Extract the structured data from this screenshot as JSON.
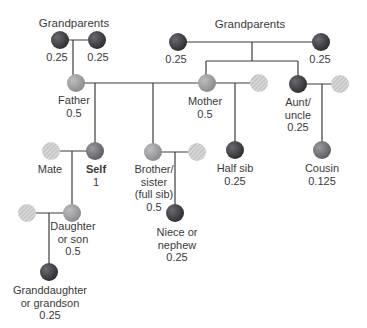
{
  "colors": {
    "line": "#3d3d3d",
    "full_dark": "#3f3f45",
    "mid": "#7a7a7e",
    "light": "#9c9c9e",
    "hatched": "#c8c8c8"
  },
  "groups": {
    "paternal_grandparents_label": "Grandparents",
    "maternal_grandparents_label": "Grandparents"
  },
  "nodes": {
    "pgp1": {
      "value": "0.25"
    },
    "pgp2": {
      "value": "0.25"
    },
    "mgp1": {
      "value": "0.25"
    },
    "mgp2": {
      "value": "0.25"
    },
    "father": {
      "label": "Father",
      "value": "0.5"
    },
    "mother": {
      "label": "Mother",
      "value": "0.5"
    },
    "aunt": {
      "label_1": "Aunt/",
      "label_2": "uncle",
      "value": "0.25"
    },
    "cousin": {
      "label": "Cousin",
      "value": "0.125"
    },
    "half_sib": {
      "label": "Half sib",
      "value": "0.25"
    },
    "mate": {
      "label": "Mate"
    },
    "self": {
      "label": "Self",
      "value": "1"
    },
    "brother": {
      "label_1": "Brother/",
      "label_2": "sister",
      "label_3": "(full sib)",
      "value": "0.5"
    },
    "niece": {
      "label_1": "Niece or",
      "label_2": "nephew",
      "value": "0.25"
    },
    "child": {
      "label_1": "Daughter",
      "label_2": "or son",
      "value": "0.5"
    },
    "grandchild": {
      "label_1": "Granddaughter",
      "label_2": "or grandson",
      "value": "0.25"
    }
  }
}
